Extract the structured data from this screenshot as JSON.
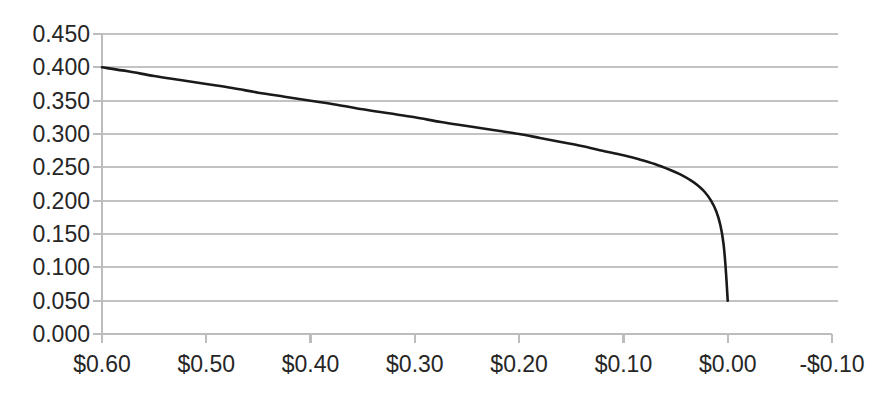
{
  "chart_data": {
    "type": "line",
    "title": "",
    "subtitle": "",
    "xlabel": "",
    "ylabel": "",
    "grid": "horizontal",
    "legend": "none",
    "x_axis_inverted": true,
    "xlim": [
      0.6,
      -0.1
    ],
    "ylim": [
      0.0,
      0.45
    ],
    "x_tick_labels": [
      "$0.60",
      "$0.50",
      "$0.40",
      "$0.30",
      "$0.20",
      "$0.10",
      "$0.00",
      "-$0.10"
    ],
    "x_tick_values": [
      0.6,
      0.5,
      0.4,
      0.3,
      0.2,
      0.1,
      0.0,
      -0.1
    ],
    "y_tick_labels": [
      "0.450",
      "0.400",
      "0.350",
      "0.300",
      "0.250",
      "0.200",
      "0.150",
      "0.100",
      "0.050",
      "0.000"
    ],
    "y_tick_values": [
      0.45,
      0.4,
      0.35,
      0.3,
      0.25,
      0.2,
      0.15,
      0.1,
      0.05,
      0.0
    ],
    "series": [
      {
        "name": "curve",
        "color": "#1a1a1a",
        "x": [
          0.6,
          0.575,
          0.55,
          0.525,
          0.5,
          0.475,
          0.45,
          0.425,
          0.4,
          0.375,
          0.35,
          0.325,
          0.3,
          0.275,
          0.25,
          0.225,
          0.2,
          0.18,
          0.16,
          0.14,
          0.12,
          0.1,
          0.085,
          0.07,
          0.055,
          0.045,
          0.035,
          0.028,
          0.022,
          0.016,
          0.011,
          0.007,
          0.004,
          0.002,
          0.0
        ],
        "y": [
          0.4,
          0.394,
          0.387,
          0.381,
          0.375,
          0.369,
          0.362,
          0.356,
          0.35,
          0.344,
          0.337,
          0.331,
          0.325,
          0.318,
          0.312,
          0.306,
          0.3,
          0.294,
          0.288,
          0.282,
          0.275,
          0.268,
          0.262,
          0.255,
          0.246,
          0.239,
          0.23,
          0.222,
          0.213,
          0.2,
          0.184,
          0.163,
          0.135,
          0.1,
          0.05
        ]
      }
    ]
  },
  "geometry": {
    "plot_left": 102,
    "plot_right": 832,
    "plot_top": 34,
    "plot_bottom": 334,
    "tick_len": 9,
    "y_label_x": 90,
    "x_label_y": 372
  },
  "colors": {
    "background": "#ffffff",
    "gridline": "#c3c3c3",
    "axis": "#bdbdbd",
    "series": "#1a1a1a",
    "text": "#262626"
  }
}
